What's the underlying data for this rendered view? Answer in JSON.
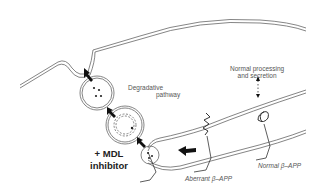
{
  "diagram": {
    "labels": {
      "degradative_line1": "Degradative",
      "degradative_line2": "pathway",
      "normal_line1": "Normal processing",
      "normal_line2": "and secretion",
      "mdl_line1": "+ MDL",
      "mdl_line2": "inhibitor",
      "aberrant": "Aberrant β–APP",
      "normal_app": "Normal β–APP"
    },
    "colors": {
      "line": "#555555",
      "arrow": "#111111",
      "text": "#555555"
    }
  }
}
